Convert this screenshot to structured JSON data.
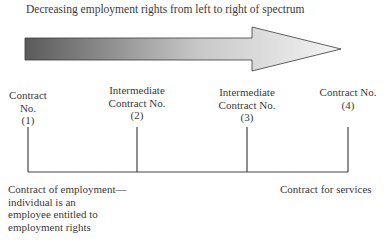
{
  "title": "Decreasing employment rights from left to right of spectrum",
  "arrow": {
    "direction": "right",
    "gradient": {
      "start": "#5a5a5a",
      "end": "#f2f2f2"
    }
  },
  "points": [
    {
      "line1": "Contract",
      "line2": "No.",
      "line3": "(1)"
    },
    {
      "line1": "Intermediate",
      "line2": "Contract No.",
      "line3": "(2)"
    },
    {
      "line1": "Intermediate",
      "line2": "Contract No.",
      "line3": "(3)"
    },
    {
      "line1": "Contract No.",
      "line2": "(4)"
    }
  ],
  "left_caption": {
    "line1": "Contract of employment—",
    "line2": "individual is an",
    "line3": "employee entitled to",
    "line4": "employment rights"
  },
  "right_caption": "Contract for services"
}
